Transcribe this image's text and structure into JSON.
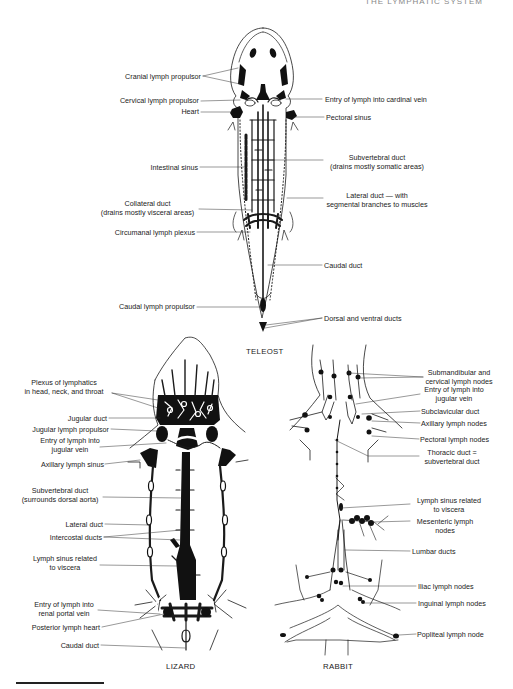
{
  "header": {
    "text": "THE LYMPHATIC SYSTEM"
  },
  "figure": {
    "panels": [
      {
        "id": "teleost",
        "title": "TELEOST"
      },
      {
        "id": "lizard",
        "title": "LIZARD"
      },
      {
        "id": "rabbit",
        "title": "RABBIT"
      }
    ]
  },
  "teleost": {
    "labels": {
      "cranial_lymph_propulsor": "Cranial lymph propulsor",
      "cervical_lymph_propulsor": "Cervical lymph propulsor",
      "heart": "Heart",
      "intestinal_sinus": "Intestinal sinus",
      "collateral_duct_1": "Collateral duct",
      "collateral_duct_2": "(drains mostly visceral areas)",
      "circumanal_lymph_plexus": "Circumanal lymph plexus",
      "caudal_lymph_propulsor": "Caudal lymph propulsor",
      "entry_cardinal_vein": "Entry of lymph into cardinal vein",
      "pectoral_sinus": "Pectoral  sinus",
      "subvertebral_duct_1": "Subvertebral duct",
      "subvertebral_duct_2": "(drains mostly somatic areas)",
      "lateral_duct_1": "Lateral duct — with",
      "lateral_duct_2": "segmental branches to muscles",
      "caudal_duct": "Caudal duct",
      "dorsal_ventral_ducts": "Dorsal and ventral ducts"
    }
  },
  "lizard": {
    "labels": {
      "plexus_1": "Plexus of lymphatics",
      "plexus_2": "in head, neck, and throat",
      "jugular_duct": "Jugular duct",
      "jugular_lymph_propulsor": "Jugular lymph propulsor",
      "entry_jugular_1": "Entry of lymph into",
      "entry_jugular_2": "jugular vein",
      "axillary_lymph_sinus": "Axillary lymph sinus",
      "subvertebral_duct_1": "Subvertebral duct",
      "subvertebral_duct_2": "(surrounds dorsal aorta)",
      "lateral_duct": "Lateral duct",
      "intercostal_ducts": "Intercostal ducts",
      "lymph_sinus_1": "Lymph sinus related",
      "lymph_sinus_2": "to viscera",
      "entry_renal_1": "Entry of lymph into",
      "entry_renal_2": "renal portal vein",
      "posterior_lymph_heart": "Posterior lymph heart",
      "caudal_duct": "Caudal duct"
    }
  },
  "rabbit": {
    "labels": {
      "submandibular_1": "Submandibular and",
      "submandibular_2": "cervical lymph nodes",
      "entry_jugular_1": "Entry of lymph into",
      "entry_jugular_2": "jugular vein",
      "subclavicular_duct": "Subclavicular duct",
      "axillary_lymph_nodes": "Axillary lymph nodes",
      "pectoral_lymph_nodes": "Pectoral lymph nodes",
      "thoracic_duct_1": "Thoracic duct =",
      "thoracic_duct_2": "subvertebral duct",
      "lymph_sinus_1": "Lymph sinus related",
      "lymph_sinus_2": "to viscera",
      "mesenteric_1": "Mesenteric lymph",
      "mesenteric_2": "nodes",
      "lumbar_ducts": "Lumbar ducts",
      "iliac_lymph_nodes": "Iliac lymph nodes",
      "inguinal_lymph_nodes": "Inguinal lymph nodes",
      "popliteal_lymph_node": "Popliteal lymph node"
    }
  }
}
